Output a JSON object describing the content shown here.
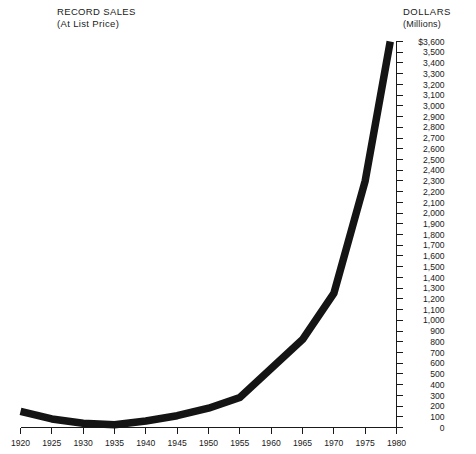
{
  "title": {
    "main": "RECORD SALES",
    "sub": "(At List Price)"
  },
  "axis_header": {
    "main": "DOLLARS",
    "sub": "(Millions)"
  },
  "chart_data": {
    "type": "line",
    "title": "RECORD SALES",
    "subtitle": "(At List Price)",
    "xlabel": "",
    "ylabel": "DOLLARS (Millions)",
    "xlim": [
      1920,
      1980
    ],
    "ylim": [
      0,
      3600
    ],
    "grid": false,
    "legend": null,
    "y_axis_position": "right",
    "y_tick_step": 100,
    "x_tick_step": 5,
    "x": [
      1920,
      1925,
      1930,
      1935,
      1940,
      1945,
      1950,
      1955,
      1960,
      1965,
      1970,
      1975,
      1979
    ],
    "values": [
      150,
      80,
      40,
      25,
      60,
      110,
      180,
      280,
      550,
      820,
      1250,
      2300,
      3600
    ],
    "x_tick_labels": [
      "1920",
      "1925",
      "1930",
      "1935",
      "1940",
      "1945",
      "1950",
      "1955",
      "1960",
      "1965",
      "1970",
      "1975",
      "1980"
    ],
    "y_tick_labels": [
      "$3,600",
      "3,500",
      "3,400",
      "3,300",
      "3,200",
      "3,100",
      "3,000",
      "2,900",
      "2,800",
      "2,700",
      "2,600",
      "2,500",
      "2,400",
      "2,300",
      "2,200",
      "2,100",
      "2,000",
      "1,900",
      "1,800",
      "1,700",
      "1,600",
      "1,500",
      "1,400",
      "1,300",
      "1,200",
      "1,100",
      "1,000",
      "900",
      "800",
      "700",
      "600",
      "500",
      "400",
      "300",
      "200",
      "100",
      "0"
    ],
    "y_tick_values": [
      3600,
      3500,
      3400,
      3300,
      3200,
      3100,
      3000,
      2900,
      2800,
      2700,
      2600,
      2500,
      2400,
      2300,
      2200,
      2100,
      2000,
      1900,
      1800,
      1700,
      1600,
      1500,
      1400,
      1300,
      1200,
      1100,
      1000,
      900,
      800,
      700,
      600,
      500,
      400,
      300,
      200,
      100,
      0
    ],
    "line_color": "#141414"
  }
}
